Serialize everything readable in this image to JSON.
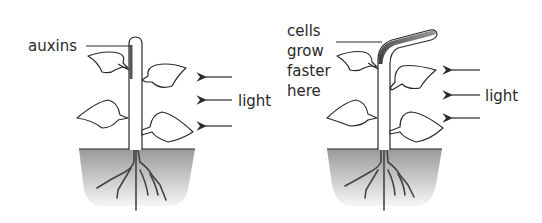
{
  "diagram": {
    "type": "phototropism",
    "panels": [
      {
        "id": "before",
        "labels": {
          "auxins": "auxins",
          "light": "light"
        },
        "light_direction": "from right",
        "arrow_count": 3
      },
      {
        "id": "after",
        "labels": {
          "cells_line1": "cells",
          "cells_line2": "grow",
          "cells_line3": "faster",
          "cells_line4": "here",
          "light": "light"
        },
        "light_direction": "from right",
        "arrow_count": 3
      }
    ],
    "colors": {
      "ink": "#2a2a2a",
      "auxin_shade": "#555555",
      "soil_top": "#9a9a9a",
      "soil_bottom": "#f4f4f4",
      "background": "#ffffff"
    }
  }
}
